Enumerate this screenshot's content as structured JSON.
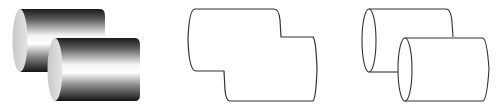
{
  "figure": {
    "width": 504,
    "height": 108,
    "background": "#ffffff",
    "panels": [
      {
        "id": "shaded",
        "description": "Two overlapping shaded metallic cylinders",
        "cylinders": [
          {
            "x": 13,
            "y": 9,
            "w": 92,
            "h": 63
          },
          {
            "x": 48,
            "y": 38,
            "w": 92,
            "h": 63
          }
        ],
        "colors": {
          "dark": "#1a1a1a",
          "light": "#ffffff",
          "cap": "#d6d6d6"
        }
      },
      {
        "id": "silhouette",
        "description": "Outline silhouette of the combined cylinders",
        "stroke": "#333333"
      },
      {
        "id": "wireframe",
        "description": "Line drawing of two overlapping cylinders with elliptical ends",
        "stroke": "#333333"
      }
    ]
  }
}
